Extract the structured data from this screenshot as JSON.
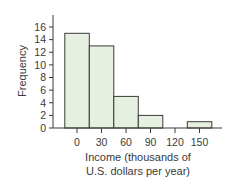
{
  "chart_data": {
    "type": "bar",
    "subtype": "histogram",
    "title": "",
    "xlabel": "Income (thousands of U.S. dollars per year)",
    "xlabel_lines": [
      "Income (thousands of",
      "U.S. dollars per year)"
    ],
    "ylabel": "Frequency",
    "categories": [
      "0",
      "30",
      "60",
      "90",
      "120",
      "150"
    ],
    "bin_centers": [
      0,
      30,
      60,
      90,
      120,
      150
    ],
    "bin_width": 30,
    "values": [
      15,
      13,
      5,
      2,
      0,
      1
    ],
    "ylim": [
      0,
      16
    ],
    "yticks": [
      0,
      2,
      4,
      6,
      8,
      10,
      12,
      14,
      16
    ],
    "xticks": [
      0,
      30,
      60,
      90,
      120,
      150
    ],
    "grid": false,
    "legend": null,
    "colors": {
      "bar_fill": "#e6f0e0",
      "bar_stroke": "#3a3a3a",
      "axis": "#3a3a3a"
    }
  }
}
